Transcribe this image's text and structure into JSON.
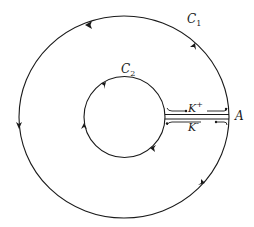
{
  "diagram": {
    "type": "contour-integration",
    "stroke_color": "#1a1a1a",
    "background": "#ffffff",
    "labels": {
      "c1": {
        "main": "C",
        "sub": "1"
      },
      "c2": {
        "main": "C",
        "sub": "2"
      },
      "k_plus": {
        "main": "K",
        "sup": "+"
      },
      "k_minus": {
        "main": "K",
        "sup": "-"
      },
      "point_a": "A"
    },
    "outer_contour": {
      "name": "C1",
      "orientation": "counterclockwise"
    },
    "inner_contour": {
      "name": "C2",
      "orientation": "clockwise"
    },
    "cut_paths": [
      {
        "name": "K+",
        "direction": "outward"
      },
      {
        "name": "K-",
        "direction": "inward"
      }
    ]
  }
}
